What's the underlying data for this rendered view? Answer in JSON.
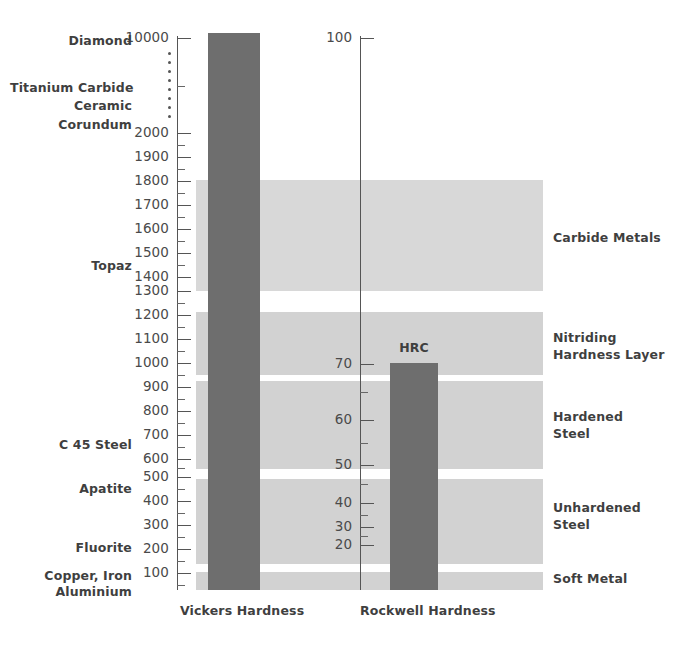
{
  "chart_data": {
    "type": "bar",
    "title": "",
    "subtitle": "",
    "xlabel": "",
    "ylabel": "",
    "grid": false,
    "legend_position": "right",
    "axes": [
      {
        "name": "Vickers Hardness",
        "label": "Vickers Hardness",
        "ticks": [
          "10000",
          "2000",
          "1900",
          "1800",
          "1700",
          "1600",
          "1500",
          "1400",
          "1300",
          "1200",
          "1100",
          "1000",
          "900",
          "800",
          "700",
          "600",
          "500",
          "400",
          "300",
          "200",
          "100"
        ],
        "break_marker": "vertical-dots",
        "break_dot_count": 8,
        "range_top": 10000,
        "range_bottom": 0
      },
      {
        "name": "Rockwell Hardness",
        "label": "Rockwell Hardness",
        "ticks": [
          "100",
          "70",
          "60",
          "50",
          "40",
          "30",
          "20"
        ],
        "range_top": 100,
        "range_bottom": 0
      }
    ],
    "series": [
      {
        "name": "Vickers Hardness",
        "cap_label": "",
        "top_value": 10000,
        "bottom_value": 0,
        "color": "#6e6e6e"
      },
      {
        "name": "Rockwell Hardness",
        "cap_label": "HRC",
        "top_value": 70,
        "bottom_value": 0,
        "color": "#6e6e6e"
      }
    ],
    "mineral_scale": [
      {
        "label": "Diamond",
        "vickers": 10000
      },
      {
        "label": "Titanium Carbide",
        "vickers": 3200
      },
      {
        "label": "Ceramic",
        "vickers": 2700
      },
      {
        "label": "Corundum",
        "vickers": 2300
      },
      {
        "label": "Topaz",
        "vickers": 1450
      },
      {
        "label": "C 45 Steel",
        "vickers": 650
      },
      {
        "label": "Apatite",
        "vickers": 480
      },
      {
        "label": "Fluorite",
        "vickers": 200
      },
      {
        "label": "Copper, Iron\nAluminium",
        "vickers": 60
      }
    ],
    "zones": [
      {
        "label": "Carbide Metals",
        "vickers_top": 1800,
        "vickers_bottom": 1300
      },
      {
        "label": "Nitriding\nHardness Layer",
        "vickers_top": 1200,
        "vickers_bottom": 930
      },
      {
        "label": "Hardened\nSteel",
        "vickers_top": 910,
        "vickers_bottom": 520
      },
      {
        "label": "Unhardened\nSteel",
        "vickers_top": 490,
        "vickers_bottom": 120
      },
      {
        "label": "Soft Metal",
        "vickers_top": 90,
        "vickers_bottom": 0
      }
    ],
    "colors": {
      "bar": "#6e6e6e",
      "zone_band": "#d2d2d2",
      "zone_band_light": "#d8d8d8",
      "text": "#3f3f3f",
      "axis": "#555555",
      "background": "#ffffff"
    }
  },
  "axis_vickers": {
    "label": "Vickers Hardness",
    "ticks": [
      {
        "text": "10000",
        "y": 38,
        "major": true
      },
      {
        "text": "2000",
        "y": 133,
        "major": true
      },
      {
        "text": "1900",
        "y": 157,
        "major": true
      },
      {
        "text": "1800",
        "y": 181,
        "major": true
      },
      {
        "text": "1700",
        "y": 205,
        "major": true
      },
      {
        "text": "1600",
        "y": 229,
        "major": true
      },
      {
        "text": "1500",
        "y": 253,
        "major": true
      },
      {
        "text": "1400",
        "y": 277,
        "major": true
      },
      {
        "text": "1300",
        "y": 291,
        "major": true
      },
      {
        "text": "1200",
        "y": 315,
        "major": true
      },
      {
        "text": "1100",
        "y": 339,
        "major": true
      },
      {
        "text": "1000",
        "y": 363,
        "major": true
      },
      {
        "text": "900",
        "y": 387,
        "major": true
      },
      {
        "text": "800",
        "y": 411,
        "major": true
      },
      {
        "text": "700",
        "y": 435,
        "major": true
      },
      {
        "text": "600",
        "y": 459,
        "major": true
      },
      {
        "text": "500",
        "y": 477,
        "major": true
      },
      {
        "text": "400",
        "y": 501,
        "major": true
      },
      {
        "text": "300",
        "y": 525,
        "major": true
      },
      {
        "text": "200",
        "y": 549,
        "major": true
      },
      {
        "text": "100",
        "y": 573,
        "major": true
      }
    ]
  },
  "axis_rockwell": {
    "label": "Rockwell Hardness",
    "ticks": [
      {
        "text": "100",
        "y": 38
      },
      {
        "text": "70",
        "y": 364
      },
      {
        "text": "60",
        "y": 420
      },
      {
        "text": "50",
        "y": 465
      },
      {
        "text": "40",
        "y": 503
      },
      {
        "text": "30",
        "y": 527
      },
      {
        "text": "20",
        "y": 545
      }
    ]
  },
  "minerals": [
    {
      "text": "Diamond",
      "y": 33
    },
    {
      "text": "Titanium Carbide",
      "y": 80
    },
    {
      "text": "Ceramic",
      "y": 98
    },
    {
      "text": "Corundum",
      "y": 117
    },
    {
      "text": "Topaz",
      "y": 258
    },
    {
      "text": "C 45 Steel",
      "y": 437
    },
    {
      "text": "Apatite",
      "y": 481
    },
    {
      "text": "Fluorite",
      "y": 540
    },
    {
      "text": "Copper, Iron",
      "y": 568
    },
    {
      "text": "Aluminium",
      "y": 584
    }
  ],
  "zones": [
    {
      "text": "Carbide Metals",
      "top": 180,
      "height": 111,
      "y_label": 229,
      "light": true
    },
    {
      "text": "Nitriding\nHardness Layer",
      "top": 312,
      "height": 63,
      "y_label": 329,
      "light": false
    },
    {
      "text": "Hardened\nSteel",
      "top": 381,
      "height": 88,
      "y_label": 408,
      "light": false
    },
    {
      "text": "Unhardened\nSteel",
      "top": 479,
      "height": 85,
      "y_label": 499,
      "light": false
    },
    {
      "text": "Soft Metal",
      "top": 572,
      "height": 18,
      "y_label": 570,
      "light": false
    }
  ],
  "bars": [
    {
      "name": "vickers-bar",
      "left": 208,
      "top": 33,
      "width": 52,
      "height": 557
    },
    {
      "name": "rockwell-bar",
      "left": 390,
      "top": 363,
      "width": 48,
      "height": 227
    }
  ],
  "bar_caps": [
    {
      "text": "HRC",
      "left": 390,
      "width": 48,
      "y": 340
    }
  ],
  "foot_labels": [
    {
      "text": "Vickers Hardness",
      "left": 180,
      "width": 110,
      "y": 603
    },
    {
      "text": "Rockwell Hardness",
      "left": 360,
      "width": 115,
      "y": 603
    }
  ],
  "break_dots": {
    "x": 168,
    "y_start": 52,
    "count": 8,
    "spacing": 9
  }
}
